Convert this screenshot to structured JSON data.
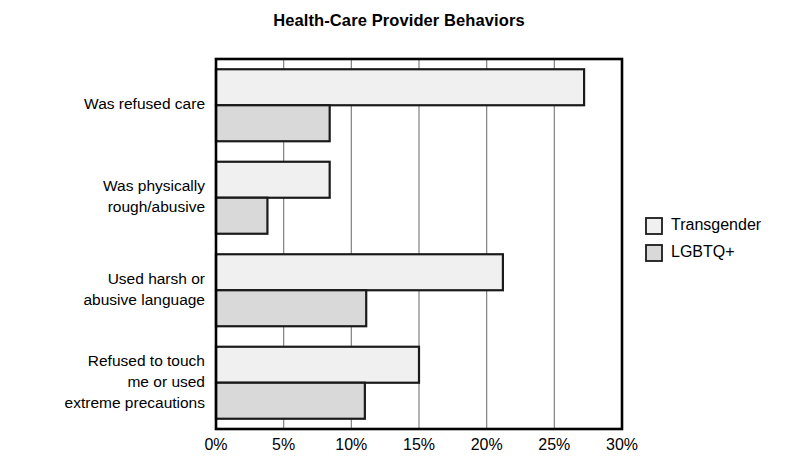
{
  "chart_data": {
    "type": "bar",
    "orientation": "horizontal",
    "title": "Health-Care Provider Behaviors",
    "xlabel": "",
    "ylabel": "",
    "categories": [
      "Was refused care",
      "Was physically rough/abusive",
      "Used harsh or abusive language",
      "Refused to touch me or used extreme precautions"
    ],
    "category_label_lines": [
      [
        "Was refused care"
      ],
      [
        "Was physically",
        "rough/abusive"
      ],
      [
        "Used harsh or",
        "abusive language"
      ],
      [
        "Refused to touch",
        "me or used",
        "extreme precautions"
      ]
    ],
    "series": [
      {
        "name": "Transgender",
        "color": "#f0f0f0",
        "values": [
          27.2,
          8.4,
          21.2,
          15.0
        ]
      },
      {
        "name": "LGBTQ+",
        "color": "#d9d9d9",
        "values": [
          8.4,
          3.8,
          11.1,
          11.0
        ]
      }
    ],
    "xlim": [
      0,
      30
    ],
    "xticks": [
      0,
      5,
      10,
      15,
      20,
      25,
      30
    ],
    "xtick_labels": [
      "0%",
      "5%",
      "10%",
      "15%",
      "20%",
      "25%",
      "30%"
    ],
    "grid": true,
    "gridline_color": "#808080",
    "axis_color": "#000000",
    "bar_edge_color": "#1a1a1a",
    "legend_position": "right",
    "legend_entries": [
      {
        "label": "Transgender",
        "color": "#f0f0f0"
      },
      {
        "label": "LGBTQ+",
        "color": "#d9d9d9"
      }
    ]
  },
  "layout": {
    "plot_left": 216,
    "plot_right": 622,
    "plot_top": 59,
    "plot_bottom": 429,
    "title_x": 399,
    "title_y": 22,
    "tick_label_y": 450,
    "legend_x": 646,
    "legend_y": 226,
    "legend_swatch": 16,
    "legend_row_gap": 27,
    "cat_label_right": 205,
    "cat_line_height": 21,
    "group_count": 4,
    "bar_height": 36
  }
}
